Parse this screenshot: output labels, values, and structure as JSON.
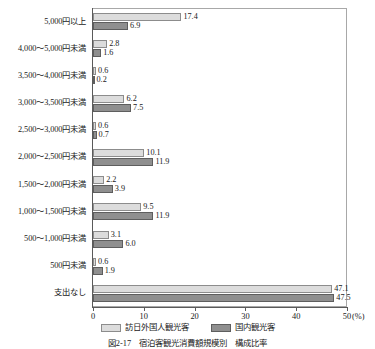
{
  "chart_data": {
    "type": "bar",
    "orientation": "horizontal",
    "title": "",
    "xlabel": "(%)",
    "ylabel": "",
    "xlim": [
      0,
      50
    ],
    "xticks": [
      0,
      10,
      20,
      30,
      40,
      50
    ],
    "xtick_labels": [
      "0",
      "10",
      "20",
      "30",
      "40",
      "50"
    ],
    "unit_label": "(%)",
    "grid": false,
    "legend_position": "bottom",
    "categories": [
      "5,000円以上",
      "4,000～5,000円未満",
      "3,500～4,000円未満",
      "3,000～3,500円未満",
      "2,500～3,000円未満",
      "2,000～2,500円未満",
      "1,500～2,000円未満",
      "1,000～1,500円未満",
      "500～1,000円未満",
      "500円未満",
      "支出なし"
    ],
    "series": [
      {
        "name": "訪日外国人観光客",
        "color": "#dcdcdc",
        "values": [
          17.4,
          2.8,
          0.6,
          6.2,
          0.6,
          10.1,
          2.2,
          9.5,
          3.1,
          0.6,
          47.1
        ],
        "labels": [
          "17.4",
          "2.8",
          "0.6",
          "6.2",
          "0.6",
          "10.1",
          "2.2",
          "9.5",
          "3.1",
          "0.6",
          "47.1"
        ]
      },
      {
        "name": "国内観光客",
        "color": "#8f8f8f",
        "values": [
          6.9,
          1.6,
          0.2,
          7.5,
          0.7,
          11.9,
          3.9,
          11.9,
          6.0,
          1.9,
          47.5
        ],
        "labels": [
          "6.9",
          "1.6",
          "0.2",
          "7.5",
          "0.7",
          "11.9",
          "3.9",
          "11.9",
          "6.0",
          "1.9",
          "47.5"
        ]
      }
    ]
  },
  "legend": {
    "items": [
      {
        "label": "訪日外国人観光客",
        "key": "s0"
      },
      {
        "label": "国内観光客",
        "key": "s1"
      }
    ]
  },
  "caption": {
    "text": "図2-17　宿泊客観光消費額規模別　構成比率"
  }
}
